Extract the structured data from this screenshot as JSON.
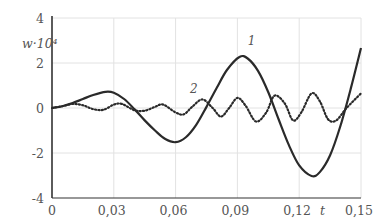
{
  "chart_data": {
    "type": "line",
    "title": "",
    "xlabel": "t",
    "ylabel": "w·10⁴",
    "xlim": [
      0,
      0.15
    ],
    "ylim": [
      -4,
      4
    ],
    "grid": true,
    "x_ticks": [
      "0",
      "0,03",
      "0,06",
      "0,09",
      "0,12",
      "0,15"
    ],
    "y_ticks": [
      "4",
      "2",
      "0",
      "-2",
      "-4"
    ],
    "series": [
      {
        "name": "1",
        "style": "solid",
        "points": [
          [
            0,
            0
          ],
          [
            0.005,
            0.08
          ],
          [
            0.01,
            0.22
          ],
          [
            0.015,
            0.4
          ],
          [
            0.02,
            0.58
          ],
          [
            0.026,
            0.72
          ],
          [
            0.03,
            0.68
          ],
          [
            0.035,
            0.4
          ],
          [
            0.04,
            -0.05
          ],
          [
            0.045,
            -0.55
          ],
          [
            0.05,
            -1.0
          ],
          [
            0.055,
            -1.38
          ],
          [
            0.06,
            -1.52
          ],
          [
            0.065,
            -1.3
          ],
          [
            0.07,
            -0.75
          ],
          [
            0.075,
            0.05
          ],
          [
            0.08,
            0.9
          ],
          [
            0.085,
            1.7
          ],
          [
            0.091,
            2.27
          ],
          [
            0.095,
            2.2
          ],
          [
            0.1,
            1.65
          ],
          [
            0.105,
            0.7
          ],
          [
            0.11,
            -0.5
          ],
          [
            0.115,
            -1.65
          ],
          [
            0.12,
            -2.55
          ],
          [
            0.126,
            -3.02
          ],
          [
            0.13,
            -2.85
          ],
          [
            0.135,
            -2.1
          ],
          [
            0.14,
            -0.8
          ],
          [
            0.145,
            0.85
          ],
          [
            0.15,
            2.67
          ]
        ]
      },
      {
        "name": "2",
        "style": "dotted",
        "points": [
          [
            0,
            0
          ],
          [
            0.005,
            0.08
          ],
          [
            0.01,
            0.18
          ],
          [
            0.015,
            0.12
          ],
          [
            0.02,
            -0.05
          ],
          [
            0.025,
            -0.08
          ],
          [
            0.03,
            0.15
          ],
          [
            0.034,
            0.18
          ],
          [
            0.04,
            -0.1
          ],
          [
            0.045,
            -0.12
          ],
          [
            0.05,
            0.05
          ],
          [
            0.054,
            0.15
          ],
          [
            0.06,
            -0.2
          ],
          [
            0.064,
            -0.28
          ],
          [
            0.068,
            0.05
          ],
          [
            0.073,
            0.38
          ],
          [
            0.078,
            0.0
          ],
          [
            0.082,
            -0.38
          ],
          [
            0.086,
            0.0
          ],
          [
            0.09,
            0.45
          ],
          [
            0.094,
            0.1
          ],
          [
            0.099,
            -0.6
          ],
          [
            0.104,
            -0.2
          ],
          [
            0.108,
            0.55
          ],
          [
            0.113,
            0.2
          ],
          [
            0.117,
            -0.55
          ],
          [
            0.121,
            -0.2
          ],
          [
            0.126,
            0.65
          ],
          [
            0.13,
            0.3
          ],
          [
            0.134,
            -0.5
          ],
          [
            0.138,
            -0.55
          ],
          [
            0.143,
            0.0
          ],
          [
            0.15,
            0.65
          ]
        ]
      }
    ],
    "annotations": [
      {
        "text": "1",
        "t": 0.095,
        "w": 2.8
      },
      {
        "text": "2",
        "t": 0.067,
        "w": 0.68
      }
    ]
  }
}
